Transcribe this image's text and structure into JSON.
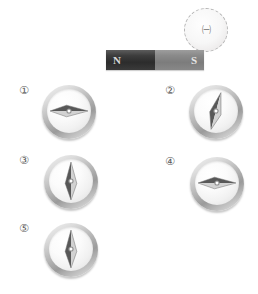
{
  "figure": {
    "title_visible": false,
    "background_color": "#ffffff",
    "width": 258,
    "height": 294
  },
  "marker": {
    "name": "dashed-region-marker",
    "label": "㈠",
    "style": "dashed-circle",
    "border_color": "#b4b4b4",
    "x": 184,
    "y": 8,
    "diameter": 44
  },
  "magnet": {
    "name": "bar-magnet",
    "x": 106,
    "y": 50,
    "width": 98,
    "height": 20,
    "poles": [
      {
        "label": "N",
        "name": "north-pole",
        "color": "#2c2c2c",
        "text_color": "#d9d9d9"
      },
      {
        "label": "S",
        "name": "south-pole",
        "color": "#7c7c7c",
        "text_color": "#e6e6e6"
      }
    ]
  },
  "compasses": [
    {
      "id": "compass-1",
      "label": "①",
      "label_x": 19,
      "label_y": 85,
      "x": 42,
      "y": 85,
      "needle_angle_deg": 90,
      "needle_description": "horizontal, dark end pointing left",
      "dark_color": "#585858",
      "light_color": "#d2d2d2"
    },
    {
      "id": "compass-2",
      "label": "②",
      "label_x": 165,
      "label_y": 85,
      "x": 189,
      "y": 85,
      "needle_angle_deg": 15,
      "needle_description": "near-vertical tilted clockwise, dark end upper-left",
      "dark_color": "#585858",
      "light_color": "#d2d2d2"
    },
    {
      "id": "compass-3",
      "label": "③",
      "label_x": 19,
      "label_y": 155,
      "x": 44,
      "y": 155,
      "needle_angle_deg": 0,
      "needle_description": "vertical, dark end pointing up-left",
      "dark_color": "#585858",
      "light_color": "#d2d2d2"
    },
    {
      "id": "compass-4",
      "label": "④",
      "label_x": 165,
      "label_y": 156,
      "x": 190,
      "y": 157,
      "needle_angle_deg": 90,
      "needle_description": "horizontal, dark end pointing left",
      "dark_color": "#585858",
      "light_color": "#d2d2d2"
    },
    {
      "id": "compass-5",
      "label": "⑤",
      "label_x": 19,
      "label_y": 223,
      "x": 44,
      "y": 223,
      "needle_angle_deg": 0,
      "needle_description": "vertical, dark end pointing up",
      "dark_color": "#585858",
      "light_color": "#d2d2d2"
    }
  ]
}
